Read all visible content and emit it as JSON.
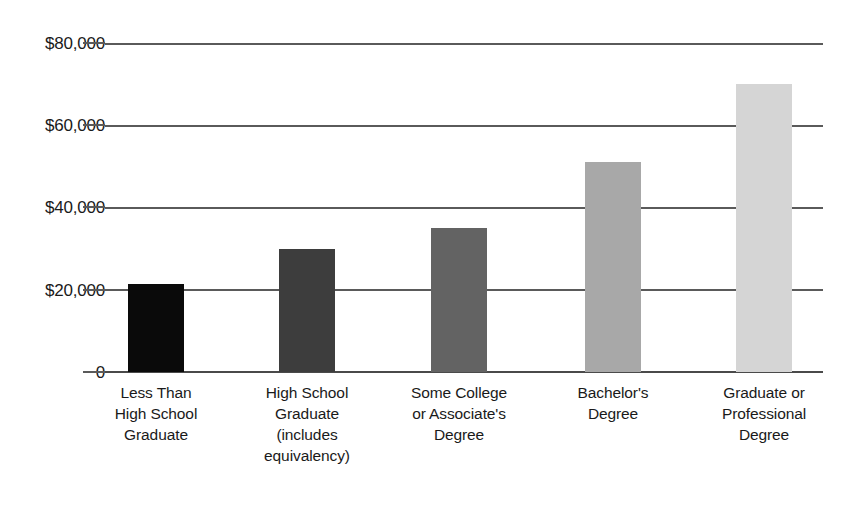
{
  "chart_data": {
    "type": "bar",
    "title": "",
    "subtitle": "",
    "xlabel": "",
    "ylabel": "",
    "categories": [
      "Less Than High School Graduate",
      "High School Graduate (includes equivalency)",
      "Some College or Associate's Degree",
      "Bachelor's Degree",
      "Graduate or Professional Degree"
    ],
    "category_lines": [
      [
        "Less Than",
        "High School",
        "Graduate"
      ],
      [
        "High School",
        "Graduate",
        "(includes",
        "equivalency)"
      ],
      [
        "Some College",
        "or Associate's",
        "Degree"
      ],
      [
        "Bachelor's",
        "Degree"
      ],
      [
        "Graduate or",
        "Professional",
        "Degree"
      ]
    ],
    "values": [
      21500,
      30000,
      35000,
      51000,
      70000
    ],
    "bar_colors": [
      "#0a0a0a",
      "#3d3d3d",
      "#636363",
      "#a8a8a8",
      "#d5d5d5"
    ],
    "ylim": [
      0,
      80000
    ],
    "yticks": [
      0,
      20000,
      40000,
      60000,
      80000
    ],
    "ytick_labels": [
      "0",
      "$20,000",
      "$40,000",
      "$60,000",
      "$80,000"
    ],
    "grid": true,
    "grid_axis": "y",
    "legend": false,
    "legend_position": "none",
    "gridline_color": "#5a5a5a",
    "background_color": "#ffffff",
    "text_color": "#1a1a1a"
  }
}
